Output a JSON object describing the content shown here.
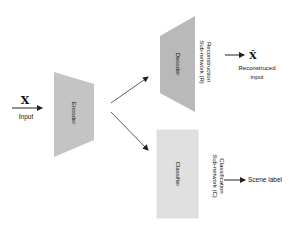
{
  "diagram": {
    "input": {
      "symbol": "X",
      "label": "Input"
    },
    "encoder": {
      "label": "Encoder",
      "color": "#c4c4c4"
    },
    "decoder": {
      "label": "Decoder",
      "color": "#b9b9b9"
    },
    "classifier": {
      "label": "Classifier",
      "color": "#e0e0e0"
    },
    "reconstruction_subnetwork": {
      "line1": "Reconstruction",
      "line2": "Sub-network (R)"
    },
    "classification_subnetwork": {
      "line1": "Classification",
      "line2": "Sub-network (C)"
    },
    "reconstructed": {
      "symbol": "X̂",
      "label_line1": "Reconstruced",
      "label_line2": "input"
    },
    "scene_label": "Scene label"
  }
}
